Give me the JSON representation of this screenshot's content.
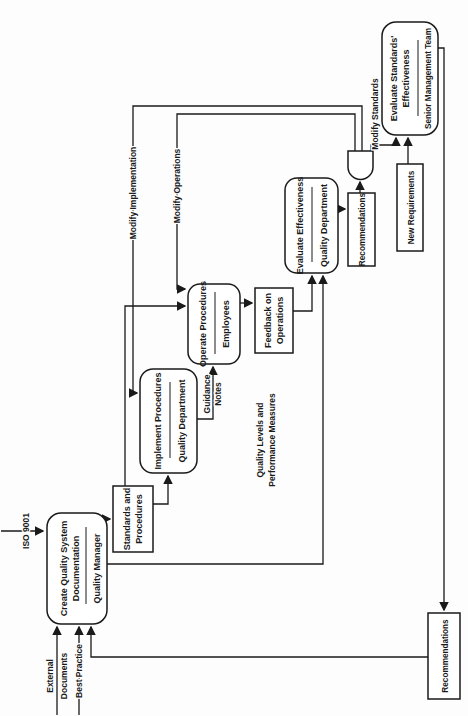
{
  "diagram": {
    "colors": {
      "ink": "#1a1a1a",
      "paper": "#ffffff"
    },
    "nodes": {
      "create": {
        "title1": "Create Quality System",
        "title2": "Documentation",
        "role": "Quality Manager"
      },
      "implement": {
        "title1": "Implement Procedures",
        "role": "Quality Department"
      },
      "operate": {
        "title1": "Operate Procedures",
        "role": "Employees"
      },
      "evaluate": {
        "title1": "Evaluate Effectiveness",
        "role": "Quality Department"
      },
      "standards_eval": {
        "title1": "Evaluate Standards'",
        "title2": "Effectiveness",
        "role": "Senior Management Team"
      },
      "standards_store": {
        "line1": "Standards and",
        "line2": "Procedures"
      },
      "feedback": {
        "line1": "Feedback on",
        "line2": "Operations"
      },
      "recommendations_small": {
        "line1": "Recommendations"
      },
      "new_requirements": {
        "line1": "New Requirements"
      },
      "recommendations_long": {
        "line1": "Recommendations"
      }
    },
    "edge_labels": {
      "iso": "ISO 9001",
      "external1": "External",
      "external2": "Documents",
      "best_practice": "Best Practice",
      "guidance1": "Guidance",
      "guidance2": "Notes",
      "quality_levels1": "Quality Levels and",
      "quality_levels2": "Performance Measures",
      "modify_implementation": "Modify Implementation",
      "modify_operations": "Modify Operations",
      "modify_standards": "Modify Standards"
    }
  }
}
